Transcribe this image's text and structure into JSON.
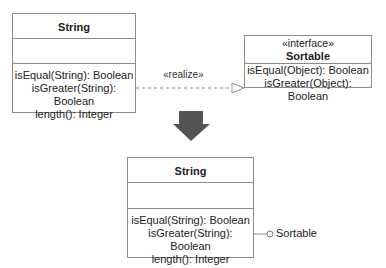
{
  "diagram": {
    "top_class": {
      "name": "String",
      "attributes": [],
      "operations": [
        "isEqual(String): Boolean",
        "isGreater(String): Boolean",
        "length(): Integer"
      ]
    },
    "interface": {
      "stereotype": "«interface»",
      "name": "Sortable",
      "operations": [
        "isEqual(Object): Boolean",
        "isGreater(Object): Boolean"
      ]
    },
    "realize_label": "«realize»",
    "bottom_class": {
      "name": "String",
      "attributes": [],
      "operations": [
        "isEqual(String): Boolean",
        "isGreater(String): Boolean",
        "length(): Integer"
      ]
    },
    "lollipop_label": "Sortable",
    "colors": {
      "border": "#8c8c8c",
      "arrow_fill": "#555555",
      "text": "#222222"
    }
  }
}
